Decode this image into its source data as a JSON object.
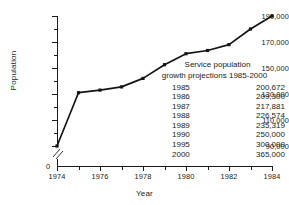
{
  "chart_data": {
    "type": "line",
    "title": "",
    "xlabel": "Year",
    "ylabel": "Population",
    "x": [
      1974,
      1975,
      1976,
      1977,
      1978,
      1979,
      1980,
      1981,
      1982,
      1983,
      1984
    ],
    "values": [
      90000,
      131000,
      133000,
      135500,
      142000,
      152500,
      161000,
      163500,
      168000,
      180000,
      190000
    ],
    "series": [
      {
        "name": "Population",
        "values": [
          90000,
          131000,
          133000,
          135500,
          142000,
          152500,
          161000,
          163500,
          168000,
          180000,
          190000
        ]
      }
    ],
    "xlim": [
      1974,
      1984
    ],
    "ylim": [
      90000,
      190000
    ],
    "y_axis_break": true,
    "y_axis_break_label": "0",
    "xticks": [
      1974,
      1975,
      1976,
      1977,
      1978,
      1979,
      1980,
      1981,
      1982,
      1983,
      1984
    ],
    "xtick_labels_shown": [
      "1974",
      "1976",
      "1978",
      "1980",
      "1982",
      "1984"
    ],
    "yticks": [
      90000,
      100000,
      110000,
      120000,
      130000,
      140000,
      150000,
      160000,
      170000,
      180000,
      190000
    ],
    "ytick_labels_shown": [
      "90,000",
      "110,000",
      "130,000",
      "150,000",
      "170,000",
      "190,000"
    ],
    "grid": false,
    "legend": "none",
    "marker": "square",
    "line_color": "#141414"
  },
  "axes": {
    "ylabel": "Population",
    "xlabel": "Year",
    "zero_label": "0",
    "ytick_labels": [
      {
        "text": "190,000",
        "value": 190000
      },
      {
        "text": "170,000",
        "value": 170000
      },
      {
        "text": "150,000",
        "value": 150000
      },
      {
        "text": "130,000",
        "value": 130000
      },
      {
        "text": "110,000",
        "value": 110000
      },
      {
        "text": "90,000",
        "value": 90000
      }
    ],
    "xtick_labels": [
      {
        "text": "1974",
        "value": 1974
      },
      {
        "text": "1976",
        "value": 1976
      },
      {
        "text": "1978",
        "value": 1978
      },
      {
        "text": "1980",
        "value": 1980
      },
      {
        "text": "1982",
        "value": 1982
      },
      {
        "text": "1984",
        "value": 1984
      }
    ]
  },
  "annotation": {
    "title_line1": "Service population",
    "title_line2": "growth projections 1985-2000",
    "rows": [
      {
        "year": "1985",
        "population": "200,672"
      },
      {
        "year": "1986",
        "population": "209,300"
      },
      {
        "year": "1987",
        "population": "217,881"
      },
      {
        "year": "1988",
        "population": "226,574"
      },
      {
        "year": "1989",
        "population": "235,319"
      },
      {
        "year": "1990",
        "population": "250,000"
      },
      {
        "year": "1995",
        "population": "300,000"
      },
      {
        "year": "2000",
        "population": "365,000"
      }
    ]
  }
}
